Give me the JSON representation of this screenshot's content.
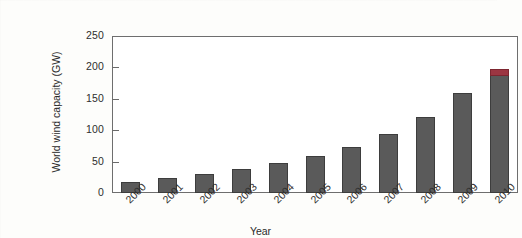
{
  "chart_data": {
    "type": "bar",
    "title": "",
    "xlabel": "Year",
    "ylabel": "World wind capacity (GW)",
    "categories": [
      "2000",
      "2001",
      "2002",
      "2003",
      "2004",
      "2005",
      "2006",
      "2007",
      "2008",
      "2009",
      "2010"
    ],
    "values": [
      17,
      24,
      31,
      39,
      47,
      59,
      74,
      94,
      121,
      159,
      198
    ],
    "series": [
      {
        "name": "World wind capacity",
        "values": [
          17,
          24,
          31,
          39,
          47,
          59,
          74,
          94,
          121,
          159,
          198
        ]
      }
    ],
    "ylim": [
      0,
      250
    ],
    "yticks": [
      0,
      50,
      100,
      150,
      200,
      250
    ],
    "ytick_labels": [
      "0",
      "50",
      "100",
      "150",
      "200",
      "250"
    ],
    "grid": false,
    "legend": "none",
    "bar_color": "#5a5a5a",
    "bar_edge_color": "#3d3d3d",
    "highlight_color": "#9c3642",
    "annotations": [
      {
        "category": "2010",
        "note": "top segment of final bar drawn in red",
        "segment_value": 12
      }
    ],
    "axis_color": "#6e6e6e",
    "background_color": "#ffffff"
  }
}
